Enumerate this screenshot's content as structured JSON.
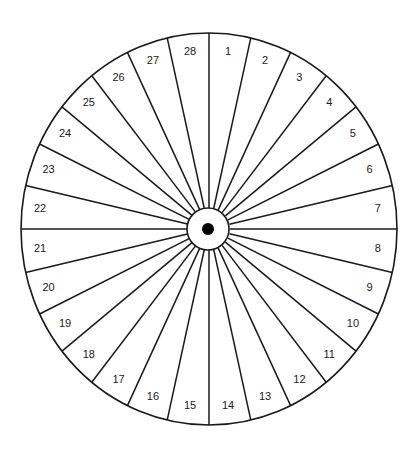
{
  "diagram": {
    "type": "segmented-wheel",
    "segment_count": 28,
    "segments": [
      "1",
      "2",
      "3",
      "4",
      "5",
      "6",
      "7",
      "8",
      "9",
      "10",
      "11",
      "12",
      "13",
      "14",
      "15",
      "16",
      "17",
      "18",
      "19",
      "20",
      "21",
      "22",
      "23",
      "24",
      "25",
      "26",
      "27",
      "28"
    ],
    "numbering": "clockwise from top",
    "colors": {
      "background": "#ffffff",
      "line": "#1a1a1a",
      "hub_fill": "#ffffff",
      "center_dot": "#000000",
      "axis_line": "#9a9a9a"
    }
  }
}
